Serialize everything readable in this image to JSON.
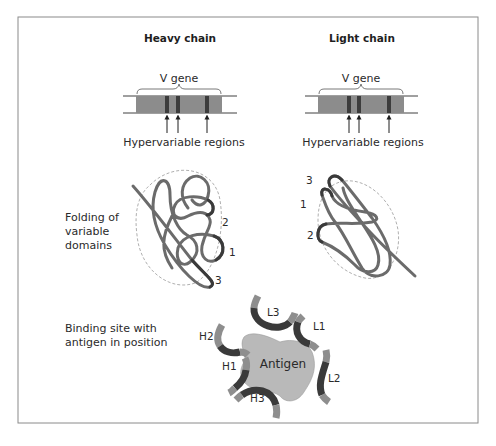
{
  "figure": {
    "columns": {
      "heavy": {
        "title": "Heavy chain",
        "gene_label": "V gene",
        "regions_label": "Hypervariable regions"
      },
      "light": {
        "title": "Light chain",
        "gene_label": "V gene",
        "regions_label": "Hypervariable regions"
      }
    },
    "rows": {
      "folding": {
        "label_lines": [
          "Folding of",
          "variable",
          "domains"
        ]
      },
      "binding": {
        "label_lines": [
          "Binding site with",
          "antigen in position"
        ]
      }
    },
    "fold_numbers": {
      "heavy": [
        "2",
        "1",
        "3"
      ],
      "light": [
        "3",
        "1",
        "2"
      ]
    },
    "binding_site": {
      "antigen_label": "Antigen",
      "loops": [
        "H2",
        "H1",
        "H3",
        "L3",
        "L1",
        "L2"
      ]
    },
    "caption_faint": ""
  },
  "colors": {
    "frame": "#8a8a8a",
    "gene_body": "#8c8c8c",
    "hypervariable": "#3c3c3c",
    "strand": "#6b6b6b",
    "strand_highlight": "#3a3a3a",
    "antigen": "#b9b9b9",
    "loop_dark": "#3a3a3a",
    "loop_light": "#8e8e8e",
    "dashed_envelope": "#9a9a9a"
  }
}
